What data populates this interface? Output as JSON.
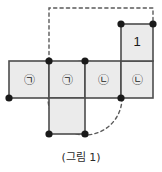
{
  "figure": {
    "caption": "(그림 1)",
    "colors": {
      "cell_fill": "#ebebeb",
      "cell_fill_plain": "#f0f0f0",
      "stroke": "#4d4d4d",
      "dashed_stroke": "#5a5a5a",
      "node_fill": "#1a1a1a",
      "text": "#1a1a1a",
      "background": "#ffffff"
    },
    "grid": {
      "unit_px": 36,
      "origin": {
        "x": 9,
        "y": 61
      }
    },
    "cells": [
      {
        "id": "cell-a1",
        "label": "㉠",
        "x": 9,
        "y": 61,
        "shaded": true
      },
      {
        "id": "cell-a2",
        "label": "㉠",
        "x": 49,
        "y": 61,
        "shaded": true
      },
      {
        "id": "cell-b1",
        "label": "㉡",
        "x": 85,
        "y": 61,
        "shaded": true
      },
      {
        "id": "cell-b2",
        "label": "㉡",
        "x": 121,
        "y": 61,
        "shaded": true
      },
      {
        "id": "cell-top-right",
        "label": "1",
        "x": 121,
        "y": 24,
        "shaded": true
      },
      {
        "id": "cell-bottom",
        "label": "",
        "x": 49,
        "y": 98,
        "shaded": true
      }
    ],
    "nodes": [
      {
        "id": "node-top-left-inner",
        "x": 49,
        "y": 61
      },
      {
        "id": "node-top-mid",
        "x": 85,
        "y": 61
      },
      {
        "id": "node-top-right-left",
        "x": 121,
        "y": 24
      },
      {
        "id": "node-top-right-right",
        "x": 153,
        "y": 24
      },
      {
        "id": "node-left-bottom",
        "x": 9,
        "y": 98
      },
      {
        "id": "node-right-bottom",
        "x": 121,
        "y": 98
      },
      {
        "id": "node-bottom-left",
        "x": 49,
        "y": 134
      },
      {
        "id": "node-bottom-right",
        "x": 85,
        "y": 134
      }
    ],
    "dashed_circle": {
      "center_x": 85,
      "center_y": 98,
      "radius": 37
    },
    "dashed_path": {
      "description": "dashed rectangle from inner top-left node up and across to top-right node",
      "points": "49,61 49,8 153,8 153,24"
    }
  }
}
